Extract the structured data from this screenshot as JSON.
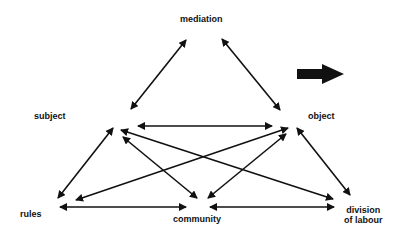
{
  "diagram": {
    "type": "activity-system-triangle",
    "nodes": {
      "mediation": "mediation",
      "subject": "subject",
      "object": "object",
      "rules": "rules",
      "community": "community",
      "division_line1": "division",
      "division_line2": "of labour"
    },
    "edges": [
      {
        "from": "subject",
        "to": "mediation",
        "direction": "bidirectional"
      },
      {
        "from": "mediation",
        "to": "object",
        "direction": "bidirectional"
      },
      {
        "from": "subject",
        "to": "object",
        "direction": "bidirectional"
      },
      {
        "from": "subject",
        "to": "rules",
        "direction": "bidirectional"
      },
      {
        "from": "subject",
        "to": "community",
        "direction": "bidirectional"
      },
      {
        "from": "subject",
        "to": "division of labour",
        "direction": "bidirectional"
      },
      {
        "from": "object",
        "to": "rules",
        "direction": "bidirectional"
      },
      {
        "from": "object",
        "to": "community",
        "direction": "bidirectional"
      },
      {
        "from": "object",
        "to": "division of labour",
        "direction": "bidirectional"
      },
      {
        "from": "rules",
        "to": "community",
        "direction": "bidirectional"
      },
      {
        "from": "community",
        "to": "division of labour",
        "direction": "bidirectional"
      }
    ],
    "outcome_arrow": "block-arrow-right",
    "colors": {
      "ink": "#111111",
      "background": "#ffffff"
    }
  }
}
